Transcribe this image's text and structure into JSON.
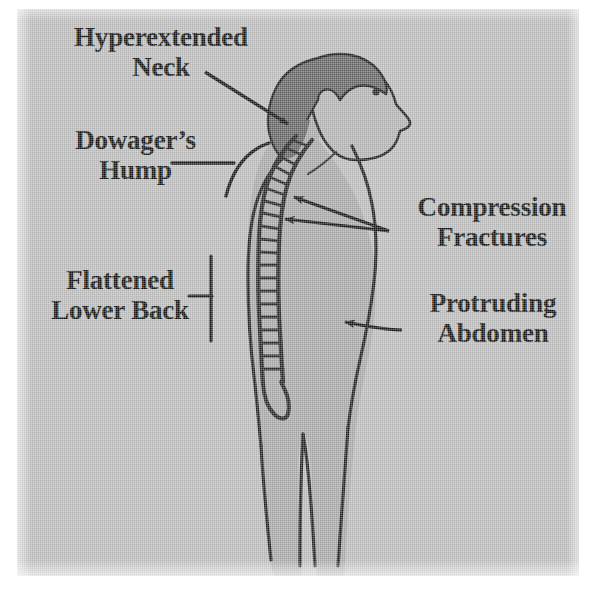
{
  "figure": {
    "background_color": "#bcbcbc",
    "ink_color": "#111111",
    "body_fill_color": "#a8a8a8",
    "hair_fill_color": "#6e6e6e",
    "face_fill_color": "#b0b0b0"
  },
  "labels": {
    "hyperextended_neck": "Hyperextended\nNeck",
    "dowagers_hump": "Dowager’s\nHump",
    "flattened_lower_back": "Flattened\nLower Back",
    "compression_fractures": "Compression\nFractures",
    "protruding_abdomen": "Protruding\nAbdomen"
  },
  "annotations": [
    {
      "name": "hyperextended-neck-leader",
      "type": "arrow",
      "label": "Hyperextended Neck",
      "from": [
        205,
        72
      ],
      "to": [
        292,
        127
      ],
      "points_at": "cervical-spine"
    },
    {
      "name": "dowagers-hump-leader",
      "type": "line-with-arc",
      "label": "Dowager’s Hump",
      "from": [
        172,
        163
      ],
      "to": [
        233,
        163
      ],
      "points_at": "thoracic-kyphosis"
    },
    {
      "name": "flattened-lower-back-bracket",
      "type": "bracket",
      "label": "Flattened Lower Back",
      "from": [
        190,
        296
      ],
      "to": [
        211,
        296
      ],
      "span": [
        255,
        341
      ],
      "points_at": "lumbar-spine"
    },
    {
      "name": "compression-fractures-arrow-upper",
      "type": "arrow",
      "label": "Compression Fractures",
      "from": [
        389,
        231
      ],
      "to": [
        290,
        196
      ],
      "points_at": "thoracic-vertebra-upper"
    },
    {
      "name": "compression-fractures-arrow-lower",
      "type": "arrow",
      "label": "Compression Fractures",
      "from": [
        389,
        231
      ],
      "to": [
        281,
        219
      ],
      "points_at": "thoracic-vertebra-lower"
    },
    {
      "name": "protruding-abdomen-arrow",
      "type": "curved-arrow",
      "label": "Protruding Abdomen",
      "from": [
        400,
        328
      ],
      "to": [
        339,
        322
      ],
      "points_at": "abdomen"
    }
  ],
  "anatomy": {
    "head": "profile facing right with dark hair mass",
    "eye_position": [
      376,
      92
    ],
    "spine_segments": 22,
    "regions": [
      "cervical",
      "thoracic",
      "lumbar",
      "sacrum"
    ],
    "legs": 2
  }
}
